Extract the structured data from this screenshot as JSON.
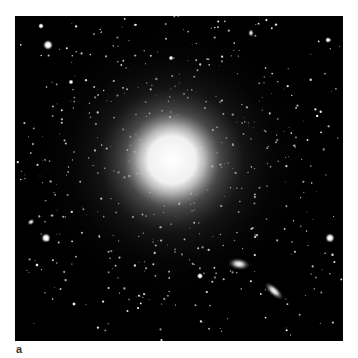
{
  "figure": {
    "panel_label": "a",
    "background": "#000000",
    "main_galaxy": {
      "cx": 157,
      "cy": 144,
      "core_r": 28,
      "halo_r": 150,
      "core_color": "#f2f2f2"
    },
    "companion_galaxies": [
      {
        "cx": 224,
        "cy": 248,
        "rx": 11,
        "ry": 6,
        "angle": 8
      },
      {
        "cx": 259,
        "cy": 275,
        "rx": 12,
        "ry": 5,
        "angle": 42
      },
      {
        "cx": 16,
        "cy": 206,
        "rx": 4,
        "ry": 3,
        "angle": -30
      },
      {
        "cx": 236,
        "cy": 17,
        "rx": 3,
        "ry": 4,
        "angle": 0
      }
    ],
    "bright_stars": [
      {
        "x": 33,
        "y": 29,
        "r": 3.2
      },
      {
        "x": 26,
        "y": 10,
        "r": 1.8
      },
      {
        "x": 31,
        "y": 222,
        "r": 3
      },
      {
        "x": 315,
        "y": 222,
        "r": 3
      },
      {
        "x": 185,
        "y": 260,
        "r": 2
      },
      {
        "x": 313,
        "y": 24,
        "r": 1.8
      },
      {
        "x": 56,
        "y": 66,
        "r": 1.6
      },
      {
        "x": 156,
        "y": 42,
        "r": 1.6
      },
      {
        "x": 59,
        "y": 288,
        "r": 1.3
      },
      {
        "x": 22,
        "y": 249,
        "r": 1.2
      }
    ]
  }
}
